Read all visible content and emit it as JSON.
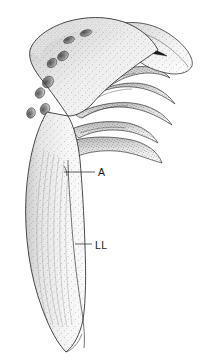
{
  "figure": {
    "kind": "scientific-line-illustration",
    "background_color": "#ffffff",
    "ink_color": "#1a1a1a",
    "stipple_color": "#555555",
    "canvas": {
      "width": 203,
      "height": 359
    }
  },
  "labels": [
    {
      "id": "a",
      "text": "A",
      "text_x": 98,
      "text_y": 176,
      "leader": {
        "x1": 64,
        "y1": 172,
        "x2": 95,
        "y2": 172
      }
    },
    {
      "id": "ll",
      "text": "LL",
      "text_x": 95,
      "text_y": 249,
      "leader": {
        "x1": 75,
        "y1": 244,
        "x2": 92,
        "y2": 244
      }
    }
  ],
  "features": {
    "dorsal_fossae_count": 8,
    "finger_projections_count": 5,
    "has_ventral_blade": true,
    "has_striations": true
  }
}
